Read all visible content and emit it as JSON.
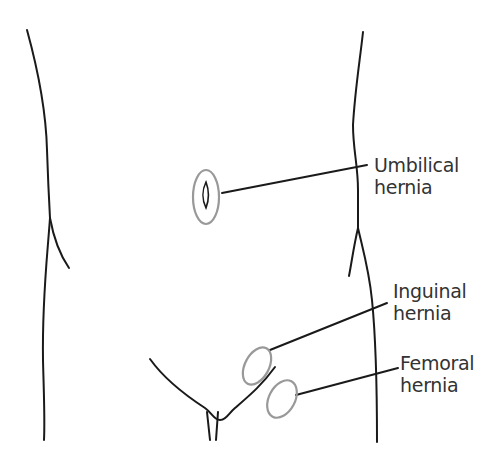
{
  "diagram": {
    "colors": {
      "outline": "#1a1a1a",
      "highlight_ring": "#999999",
      "text": "#333333",
      "background": "#ffffff"
    },
    "labels": [
      {
        "id": "umbilical",
        "line1": "Umbilical",
        "line2": "hernia"
      },
      {
        "id": "inguinal",
        "line1": "Inguinal",
        "line2": "hernia"
      },
      {
        "id": "femoral",
        "line1": "Femoral",
        "line2": "hernia"
      }
    ]
  }
}
